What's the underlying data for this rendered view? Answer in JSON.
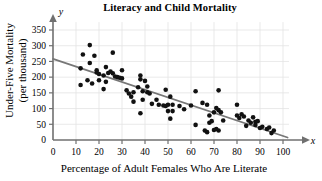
{
  "chart_data": {
    "type": "scatter",
    "title": "Literacy and Child Mortality",
    "xlabel": "Percentage of Adult Females Who Are Literate",
    "ylabel_line1": "Under-Five Mortality",
    "ylabel_line2": "(per thousand)",
    "x_axis_variable": "x",
    "y_axis_variable": "y",
    "xlim": [
      0,
      100
    ],
    "ylim": [
      0,
      375
    ],
    "xticks": [
      0,
      10,
      20,
      30,
      40,
      50,
      60,
      70,
      80,
      90,
      100
    ],
    "yticks": [
      50,
      100,
      150,
      200,
      250,
      300,
      350
    ],
    "grid": true,
    "legend": "none",
    "marker_color": "#111111",
    "trendline": {
      "label": "least-squares regression line",
      "color": "#777777",
      "x_start": 0,
      "y_start": 258,
      "x_end": 102,
      "y_end": 8
    },
    "points": [
      [
        12,
        228
      ],
      [
        12,
        175
      ],
      [
        13,
        272
      ],
      [
        15,
        190
      ],
      [
        16,
        302
      ],
      [
        16,
        245
      ],
      [
        17,
        180
      ],
      [
        18,
        268
      ],
      [
        19,
        215
      ],
      [
        19,
        222
      ],
      [
        20,
        210
      ],
      [
        20,
        190
      ],
      [
        22,
        205
      ],
      [
        22,
        162
      ],
      [
        23,
        232
      ],
      [
        23,
        185
      ],
      [
        24,
        213
      ],
      [
        25,
        218
      ],
      [
        26,
        278
      ],
      [
        26,
        212
      ],
      [
        27,
        202
      ],
      [
        28,
        200
      ],
      [
        29,
        198
      ],
      [
        30,
        222
      ],
      [
        30,
        196
      ],
      [
        32,
        158
      ],
      [
        33,
        148
      ],
      [
        34,
        138
      ],
      [
        35,
        152
      ],
      [
        35,
        122
      ],
      [
        37,
        168
      ],
      [
        38,
        205
      ],
      [
        38,
        193
      ],
      [
        38,
        85
      ],
      [
        39,
        155
      ],
      [
        39,
        128
      ],
      [
        40,
        188
      ],
      [
        41,
        152
      ],
      [
        41,
        170
      ],
      [
        42,
        148
      ],
      [
        43,
        115
      ],
      [
        45,
        128
      ],
      [
        46,
        112
      ],
      [
        48,
        110
      ],
      [
        49,
        160
      ],
      [
        49,
        108
      ],
      [
        50,
        92
      ],
      [
        50,
        112
      ],
      [
        51,
        138
      ],
      [
        51,
        68
      ],
      [
        52,
        112
      ],
      [
        52,
        92
      ],
      [
        55,
        108
      ],
      [
        57,
        98
      ],
      [
        60,
        110
      ],
      [
        62,
        155
      ],
      [
        62,
        48
      ],
      [
        65,
        118
      ],
      [
        66,
        30
      ],
      [
        67,
        112
      ],
      [
        67,
        25
      ],
      [
        68,
        78
      ],
      [
        68,
        55
      ],
      [
        69,
        60
      ],
      [
        70,
        88
      ],
      [
        70,
        32
      ],
      [
        71,
        102
      ],
      [
        71,
        35
      ],
      [
        72,
        158
      ],
      [
        72,
        95
      ],
      [
        72,
        30
      ],
      [
        73,
        88
      ],
      [
        74,
        62
      ],
      [
        80,
        112
      ],
      [
        80,
        78
      ],
      [
        81,
        70
      ],
      [
        82,
        82
      ],
      [
        83,
        75
      ],
      [
        84,
        45
      ],
      [
        85,
        62
      ],
      [
        86,
        55
      ],
      [
        87,
        72
      ],
      [
        88,
        58
      ],
      [
        88,
        48
      ],
      [
        89,
        60
      ],
      [
        90,
        38
      ],
      [
        91,
        42
      ],
      [
        93,
        35
      ],
      [
        94,
        40
      ],
      [
        95,
        22
      ],
      [
        96,
        30
      ]
    ]
  }
}
